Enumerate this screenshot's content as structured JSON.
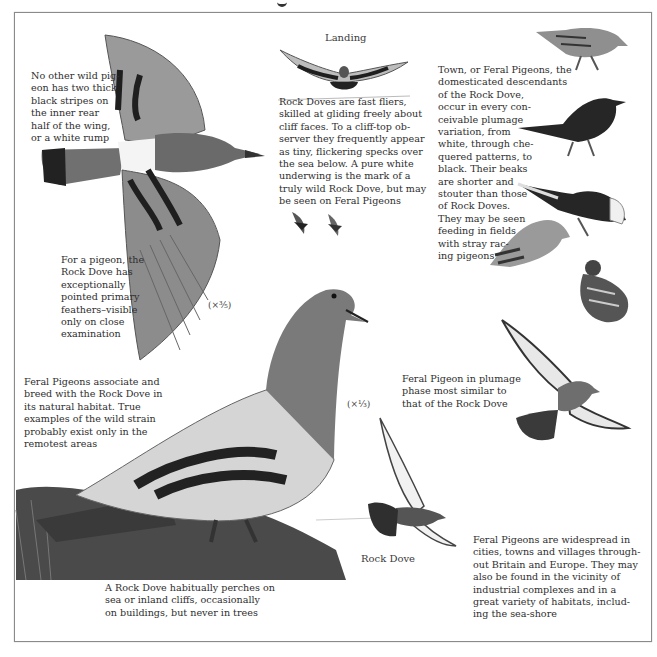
{
  "page": {
    "labels": {
      "landing": "Landing",
      "rock_dove": "Rock Dove"
    },
    "scales": {
      "flying_rock_dove": "(×³⁄₅)",
      "perched_rock_dove": "(×¹⁄₃)"
    },
    "captions": {
      "white_rump": "No other wild pig-\neon has two thick\nblack stripes on\nthe inner rear\nhalf of the wing,\nor a white rump",
      "pointed_primaries": "For a pigeon, the\nRock Dove has\nexceptionally\npointed primary\nfeathers–visible\nonly on close\nexamination",
      "fast_fliers": "Rock Doves are fast fliers,\nskilled at gliding freely about\ncliff faces. To a cliff-top ob-\nserver they frequently appear\nas tiny, flickering specks over\nthe sea below. A pure white\nunderwing is the mark of a\ntruly wild Rock Dove, but may\nbe seen on Feral Pigeons",
      "town_pigeons": "Town, or Feral Pigeons, the\ndomesticated descendants\nof the Rock Dove,\noccur in every con-\nceivable plumage\nvariation, from\nwhite, through che-\nquered patterns, to\nblack. Their beaks\nare shorter and\nstouter than those\nof Rock Doves.\nThey may be seen\nfeeding in fields\nwith stray rac-\ning pigeons",
      "associate_breed": "Feral Pigeons associate and\nbreed with the Rock Dove in\nits natural habitat. True\nexamples of the wild strain\nprobably exist only in the\nremotest areas",
      "plumage_phase": "Feral Pigeon in plumage\nphase most similar to\nthat of the Rock Dove",
      "perches": "A Rock Dove habitually perches on\nsea or inland cliffs, occasionally\non buildings, but never in trees",
      "widespread": "Feral Pigeons are widespread in\ncities, towns and villages through-\nout Britain and Europe. They may\nalso be found in the vicinity of\nindustrial complexes and in a\ngreat variety of habitats, includ-\ning the sea-shore"
    },
    "colors": {
      "ink": "#2e2e2e",
      "frame": "#8a8a8a",
      "dark_plumage": "#2a2a2a",
      "grey_plumage": "#8e8e8e",
      "pale_plumage": "#cfcfcf"
    }
  }
}
